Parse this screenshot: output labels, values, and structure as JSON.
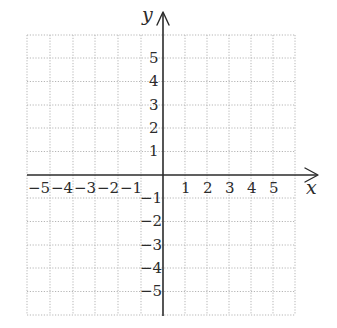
{
  "diagram": {
    "type": "coordinate-plane",
    "axes": {
      "x_label": "x",
      "y_label": "y"
    },
    "x_ticks": [
      "−5",
      "−4",
      "−3",
      "−2",
      "−1",
      "1",
      "2",
      "3",
      "4",
      "5"
    ],
    "y_ticks_positive": [
      "5",
      "4",
      "3",
      "2",
      "1"
    ],
    "y_ticks_negative": [
      "−1",
      "−2",
      "−3",
      "−4",
      "−5"
    ],
    "grid": {
      "x_range": [
        -6,
        6
      ],
      "y_range": [
        -6,
        6
      ],
      "style": "dotted",
      "color": "#b5b5b5"
    },
    "axis_color": "#2b2b2b"
  }
}
